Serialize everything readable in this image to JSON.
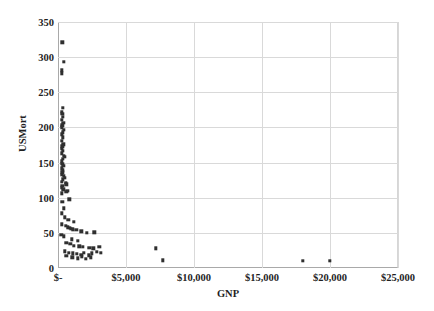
{
  "chart_data": {
    "type": "scatter",
    "title": "",
    "xlabel": "GNP",
    "ylabel": "USMort",
    "xlim": [
      0,
      25000
    ],
    "ylim": [
      0,
      350
    ],
    "grid": true,
    "legend": false,
    "xticks": [
      0,
      5000,
      10000,
      15000,
      20000,
      25000
    ],
    "xtick_labels": [
      "$-",
      "$5,000",
      "$10,000",
      "$15,000",
      "$20,000",
      "$25,000"
    ],
    "yticks": [
      0,
      50,
      100,
      150,
      200,
      250,
      300,
      350
    ],
    "ytick_labels": [
      "0",
      "50",
      "100",
      "150",
      "200",
      "250",
      "300",
      "350"
    ],
    "series": [
      {
        "name": "Countries",
        "marker": "square",
        "color": "#2f2f2f",
        "points": [
          [
            330,
            321
          ],
          [
            430,
            293
          ],
          [
            300,
            281
          ],
          [
            260,
            277
          ],
          [
            340,
            228
          ],
          [
            300,
            222
          ],
          [
            330,
            219
          ],
          [
            350,
            215
          ],
          [
            300,
            211
          ],
          [
            380,
            207
          ],
          [
            330,
            203
          ],
          [
            300,
            200
          ],
          [
            420,
            197
          ],
          [
            360,
            193
          ],
          [
            300,
            190
          ],
          [
            340,
            186
          ],
          [
            300,
            181
          ],
          [
            390,
            176
          ],
          [
            330,
            173
          ],
          [
            300,
            170
          ],
          [
            360,
            167
          ],
          [
            300,
            163
          ],
          [
            430,
            160
          ],
          [
            500,
            158
          ],
          [
            350,
            155
          ],
          [
            300,
            152
          ],
          [
            330,
            148
          ],
          [
            390,
            145
          ],
          [
            300,
            142
          ],
          [
            360,
            139
          ],
          [
            330,
            136
          ],
          [
            300,
            133
          ],
          [
            420,
            131
          ],
          [
            480,
            128
          ],
          [
            350,
            126
          ],
          [
            300,
            123
          ],
          [
            560,
            121
          ],
          [
            620,
            119
          ],
          [
            330,
            117
          ],
          [
            300,
            114
          ],
          [
            380,
            112
          ],
          [
            680,
            110
          ],
          [
            600,
            108
          ],
          [
            300,
            106
          ],
          [
            820,
            98
          ],
          [
            330,
            94
          ],
          [
            420,
            85
          ],
          [
            300,
            78
          ],
          [
            520,
            72
          ],
          [
            760,
            69
          ],
          [
            1180,
            66
          ],
          [
            300,
            62
          ],
          [
            560,
            60
          ],
          [
            700,
            58
          ],
          [
            860,
            57
          ],
          [
            960,
            56
          ],
          [
            1070,
            55
          ],
          [
            1340,
            54
          ],
          [
            1700,
            52
          ],
          [
            2100,
            50
          ],
          [
            2680,
            51
          ],
          [
            250,
            47
          ],
          [
            430,
            45
          ],
          [
            1000,
            41
          ],
          [
            1460,
            39
          ],
          [
            620,
            36
          ],
          [
            900,
            34
          ],
          [
            1180,
            32
          ],
          [
            1560,
            31
          ],
          [
            1820,
            30
          ],
          [
            2310,
            29
          ],
          [
            2600,
            28
          ],
          [
            3050,
            30
          ],
          [
            7200,
            28
          ],
          [
            500,
            24
          ],
          [
            780,
            22
          ],
          [
            1100,
            21
          ],
          [
            1380,
            20
          ],
          [
            1700,
            19
          ],
          [
            1900,
            22
          ],
          [
            2250,
            18
          ],
          [
            2500,
            21
          ],
          [
            2850,
            23
          ],
          [
            3150,
            22
          ],
          [
            620,
            17
          ],
          [
            1050,
            15
          ],
          [
            1450,
            14
          ],
          [
            1750,
            16
          ],
          [
            2050,
            13
          ],
          [
            2400,
            15
          ],
          [
            7700,
            11
          ],
          [
            18000,
            10
          ],
          [
            20000,
            10
          ]
        ]
      }
    ]
  },
  "background_text": {
    "lines": [
      "",
      "",
      "",
      "",
      "",
      "",
      "",
      "",
      "",
      "",
      "",
      "",
      "",
      "",
      "",
      "",
      ""
    ]
  }
}
